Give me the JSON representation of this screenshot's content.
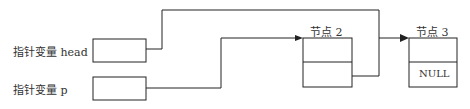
{
  "pointers": [
    {
      "label": "指针变量 head"
    },
    {
      "label": "指针变量 p"
    }
  ],
  "nodes": [
    {
      "title": "节点 2",
      "next_value": ""
    },
    {
      "title": "节点 3",
      "next_value": "NULL"
    }
  ],
  "colors": {
    "line": "#222222",
    "background": "#ffffff"
  }
}
